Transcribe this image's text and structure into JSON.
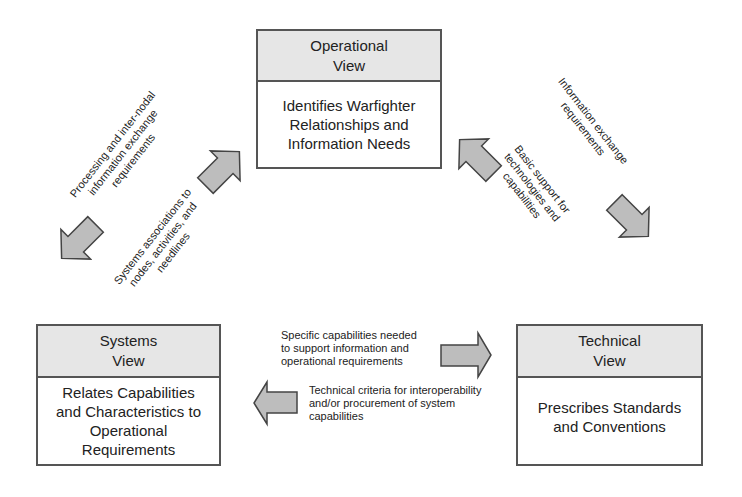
{
  "views": {
    "operational": {
      "title_line1": "Operational",
      "title_line2": "View",
      "body_line1": "Identifies Warfighter",
      "body_line2": "Relationships and",
      "body_line3": "Information Needs"
    },
    "systems": {
      "title_line1": "Systems",
      "title_line2": "View",
      "body_line1": "Relates Capabilities",
      "body_line2": "and Characteristics to",
      "body_line3": "Operational",
      "body_line4": "Requirements"
    },
    "technical": {
      "title_line1": "Technical",
      "title_line2": "View",
      "body_line1": "Prescribes Standards",
      "body_line2": "and Conventions"
    }
  },
  "relations": {
    "op_to_sys": {
      "line1": "Processing and inter-nodal",
      "line2": "information exchange",
      "line3": "requirements"
    },
    "sys_to_op": {
      "line1": "Systems associations to",
      "line2": "nodes, activities, and",
      "line3": "needlines"
    },
    "op_to_tech": {
      "line1": "Information exchange",
      "line2": "requirements"
    },
    "tech_to_op": {
      "line1": "Basic support for",
      "line2": "technologies and",
      "line3": "capabilities"
    },
    "sys_to_tech": {
      "line1": "Specific capabilities needed",
      "line2": "to support information and",
      "line3": "operational requirements"
    },
    "tech_to_sys": {
      "line1": "Technical criteria for interoperability",
      "line2": "and/or procurement of system",
      "line3": "capabilities"
    }
  },
  "colors": {
    "header_fill": "#e6e6e6",
    "border": "#555555",
    "arrow_fill": "#bdbdbd",
    "arrow_stroke": "#444444"
  }
}
